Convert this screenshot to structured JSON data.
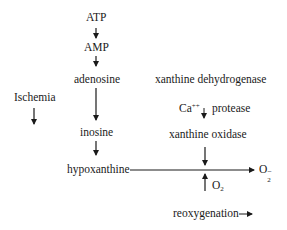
{
  "diagram": {
    "nodes": {
      "atp": "ATP",
      "amp": "AMP",
      "adenosine": "adenosine",
      "inosine": "inosine",
      "hypoxanthine": "hypoxanthine",
      "ischemia": "Ischemia",
      "xanthine_dehydrogenase": "xanthine dehydrogenase",
      "ca": "Ca",
      "ca_sup": "++",
      "protease": "protease",
      "xanthine_oxidase": "xanthine oxidase",
      "o2_input": "O",
      "o2_input_sub": "2",
      "superoxide": "O",
      "superoxide_sub": "2",
      "superoxide_sup": "−",
      "reoxygenation": "reoxygenation"
    },
    "edges": [
      {
        "from": "ATP",
        "to": "AMP"
      },
      {
        "from": "AMP",
        "to": "adenosine"
      },
      {
        "from": "adenosine",
        "to": "inosine"
      },
      {
        "from": "inosine",
        "to": "hypoxanthine"
      },
      {
        "from": "hypoxanthine",
        "to": "O2-",
        "via": "xanthine oxidase"
      },
      {
        "from": "xanthine oxidase",
        "to": "reaction"
      },
      {
        "from": "O2",
        "to": "reaction"
      },
      {
        "from": "Ca++",
        "to": "protease"
      }
    ],
    "colors": {
      "ink": "#1a1a1a",
      "background": "#ffffff"
    }
  }
}
